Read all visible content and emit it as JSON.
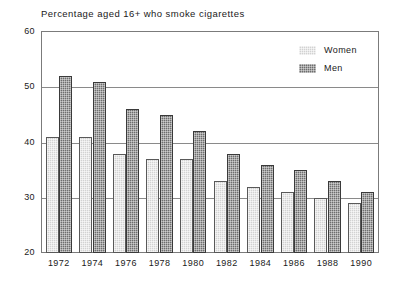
{
  "chart_data": {
    "type": "bar",
    "title": "Percentage aged 16+ who smoke cigarettes",
    "xlabel": "",
    "ylabel": "",
    "ylim": [
      20,
      60
    ],
    "yticks": [
      20,
      30,
      40,
      50,
      60
    ],
    "grid": true,
    "legend_position": "top-right",
    "categories": [
      "1972",
      "1974",
      "1976",
      "1978",
      "1980",
      "1982",
      "1984",
      "1986",
      "1988",
      "1990"
    ],
    "series": [
      {
        "name": "Women",
        "color": "#d2d2d2",
        "values": [
          41,
          41,
          38,
          37,
          37,
          33,
          32,
          31,
          30,
          29
        ]
      },
      {
        "name": "Men",
        "color": "#6e6e6e",
        "values": [
          52,
          51,
          46,
          45,
          42,
          38,
          36,
          35,
          33,
          31
        ]
      }
    ]
  },
  "legend": {
    "items": [
      {
        "label": "Women"
      },
      {
        "label": "Men"
      }
    ]
  }
}
